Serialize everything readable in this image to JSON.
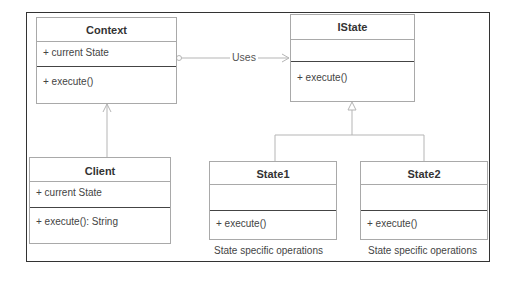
{
  "diagram": {
    "type": "UML class diagram",
    "classes": {
      "context": {
        "name": "Context",
        "attributes": [
          "+ current State"
        ],
        "operations": [
          "+ execute()"
        ]
      },
      "istate": {
        "name": "IState",
        "attributes": [],
        "operations": [
          "+ execute()"
        ]
      },
      "client": {
        "name": "Client",
        "attributes": [
          "+ current State"
        ],
        "operations": [
          "+ execute(): String"
        ]
      },
      "state1": {
        "name": "State1",
        "attributes": [],
        "operations": [
          "+ execute()"
        ],
        "note": "State specific operations"
      },
      "state2": {
        "name": "State2",
        "attributes": [],
        "operations": [
          "+ execute()"
        ],
        "note": "State specific operations"
      }
    },
    "relations": {
      "context_istate": {
        "label": "Uses",
        "kind": "association",
        "from": "Context",
        "to": "IState"
      },
      "client_context": {
        "kind": "dependency-arrow",
        "from": "Client",
        "to": "Context"
      },
      "state1_istate": {
        "kind": "generalization",
        "from": "State1",
        "to": "IState"
      },
      "state2_istate": {
        "kind": "generalization",
        "from": "State2",
        "to": "IState"
      }
    },
    "colors": {
      "line": "#a9a9a9",
      "frame": "#333333",
      "divider": "#444444"
    }
  }
}
